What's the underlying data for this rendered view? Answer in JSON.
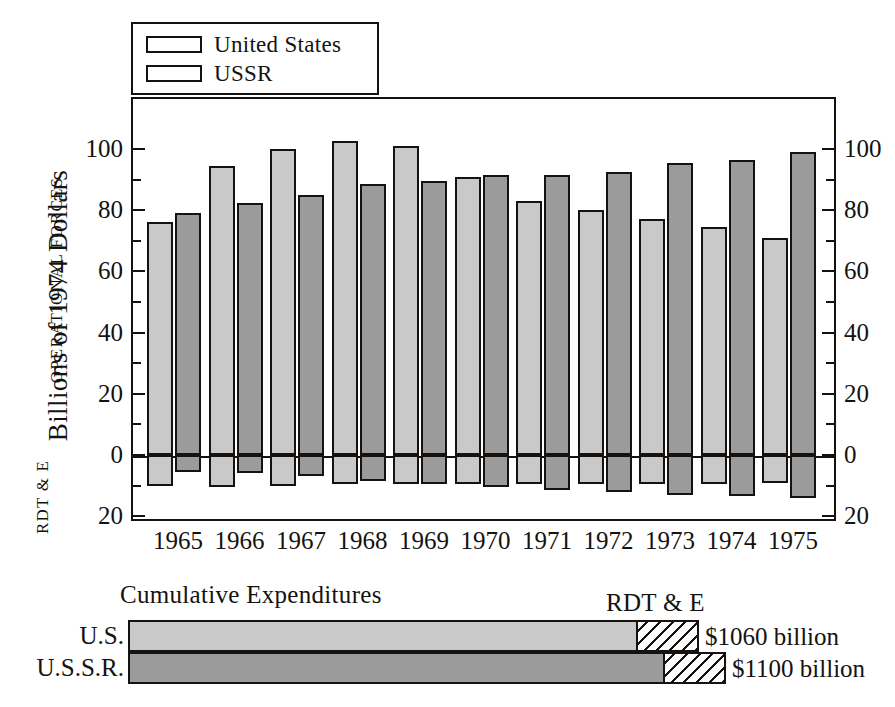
{
  "chart_data": {
    "type": "bar",
    "title": "",
    "xlabel": "",
    "ylabel": "Billions of 1974 Dollars",
    "categories": [
      "1965",
      "1966",
      "1967",
      "1968",
      "1969",
      "1970",
      "1971",
      "1972",
      "1973",
      "1974",
      "1975"
    ],
    "ylim": [
      -20,
      105
    ],
    "grid": false,
    "legend_position": "top-left",
    "axis_sections": [
      {
        "name": "OPERATIONAL FORCES",
        "direction": "up"
      },
      {
        "name": "RDT & E",
        "direction": "down"
      }
    ],
    "left_axis_ticks": [
      "100",
      "80",
      "60",
      "40",
      "20",
      "0",
      "20"
    ],
    "right_axis_ticks": [
      "100",
      "80",
      "60",
      "40",
      "20",
      "0",
      "20"
    ],
    "series": [
      {
        "name": "United States",
        "color": "#c9c9c9",
        "operational_forces": [
          76,
          94.5,
          100,
          102.5,
          101,
          91,
          83,
          80,
          77,
          74.5,
          71
        ],
        "rdt_and_e": [
          10,
          10.5,
          10,
          9.5,
          9.5,
          9.5,
          9.5,
          9.5,
          9.5,
          9.5,
          9
        ]
      },
      {
        "name": "USSR",
        "color": "#9b9b9b",
        "operational_forces": [
          79,
          82.5,
          85,
          88.5,
          89.5,
          91.5,
          91.5,
          92.5,
          95.5,
          96.5,
          99
        ],
        "rdt_and_e": [
          5.5,
          6,
          7,
          8.5,
          9.5,
          10.5,
          11.5,
          12,
          13,
          13.5,
          14
        ]
      }
    ],
    "cumulative": {
      "title": "Cumulative Expenditures",
      "rdte_annotation": "RDT & E",
      "rows": [
        {
          "label": "U.S.",
          "value_label": "$1060 billion",
          "operational_width": 510,
          "rdte_width": 63,
          "fill": "#c9c9c9"
        },
        {
          "label": "U.S.S.R.",
          "label2": "",
          "value_label": "$1100 billion",
          "operational_width": 537,
          "rdte_width": 63,
          "fill": "#9b9b9b"
        }
      ]
    }
  },
  "legend": {
    "items": [
      {
        "label": "United States",
        "color": "#c9c9c9"
      },
      {
        "label": "USSR",
        "color": "#9b9b9b"
      }
    ]
  },
  "colors": {
    "us_fill": "#c9c9c9",
    "ussr_fill": "#9b9b9b",
    "outline": "#15120f",
    "background": "#ffffff"
  }
}
